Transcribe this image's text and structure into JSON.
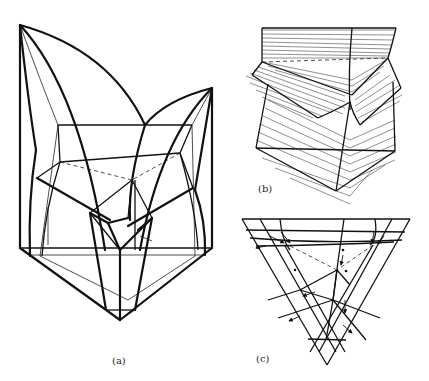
{
  "figure": {
    "panels": [
      {
        "id": "a",
        "caption": "(a)",
        "description": "3D ternary phase diagram with liquidus surfaces and three-phase regions"
      },
      {
        "id": "b",
        "caption": "(b)",
        "description": "Tie-line (conjugate line) surfaces of three-phase regions"
      },
      {
        "id": "c",
        "caption": "(c)",
        "description": "Projection onto composition triangle ABC"
      }
    ],
    "panel_a": {
      "labels": {
        "TA": "T",
        "TA_sub": "A",
        "TB": "T",
        "TB_sub": "B",
        "TC": "T",
        "TC_sub": "C",
        "a1": "a",
        "a1_sub": "1",
        "e1": "e",
        "e1_sub": "1",
        "b1": "b",
        "b1_sub": "1",
        "alpha": "α",
        "beta": "β",
        "a": "a",
        "b": "b",
        "a2": "a",
        "a2_sub": "2",
        "b2": "b",
        "b2_sub": "2",
        "c": "c",
        "p": "p",
        "c2": "c",
        "c2_sub": "2",
        "c3": "c",
        "c3_sub": "3",
        "p2": "p",
        "p2_sub": "2",
        "p3": "p",
        "p3_sub": "3",
        "a1p": "a′",
        "a1p_sub": "1",
        "a2p": "a′",
        "a2p_sub": "2",
        "b1p": "b′",
        "b1p_sub": "1",
        "b2p": "b′",
        "b2p_sub": "2",
        "A": "A",
        "B": "B",
        "C": "C",
        "f": "f",
        "g": "g",
        "h": "h",
        "gamma": "γ",
        "c2p": "c′",
        "c2p_sub": "2",
        "c3p": "c′",
        "c3p_sub": "3"
      }
    },
    "panel_b": {
      "labels": {
        "a1": "a",
        "a1_sub": "1",
        "e1": "e",
        "e1_sub": "1",
        "b1": "b",
        "b1_sub": "1",
        "a": "a",
        "b": "b",
        "a2": "a",
        "a2_sub": "2",
        "b2": "b",
        "b2_sub": "2",
        "c": "c",
        "p": "p",
        "c2": "c",
        "c2_sub": "2",
        "c3": "c",
        "c3_sub": "3",
        "p2": "p",
        "p2_sub": "2",
        "p3": "p",
        "p3_sub": "3",
        "f": "f",
        "g": "g",
        "h": "h"
      }
    },
    "panel_c": {
      "labels": {
        "A": "A",
        "B": "B",
        "C": "C",
        "a1p": "a′",
        "a1p_sub": "1",
        "a1": "a",
        "a1_sub": "1",
        "e1": "e",
        "e1_sub": "1",
        "b1": "b",
        "b1_sub": "1",
        "b1p": "b′",
        "b1p_sub": "1",
        "alpha": "α",
        "beta": "β",
        "f": "f",
        "g": "g",
        "a": "a",
        "b": "b",
        "a2p": "a′",
        "a2p_sub": "2",
        "a2": "a",
        "a2_sub": "2",
        "b2p": "b′",
        "b2p_sub": "2",
        "b2": "b",
        "b2_sub": "2",
        "region_I": "I",
        "region_II": "Ⅱ",
        "region_III": "Ⅲ",
        "c": "c",
        "c2": "c",
        "c2_sub": "2",
        "c3": "c",
        "c3_sub": "3",
        "p": "p",
        "p2": "p",
        "p2_sub": "2",
        "p3": "p",
        "p3_sub": "3",
        "h": "h",
        "gamma": "γ",
        "c2p": "c′",
        "c2p_sub": "2",
        "c3p": "c′",
        "c3p_sub": "3"
      }
    }
  }
}
